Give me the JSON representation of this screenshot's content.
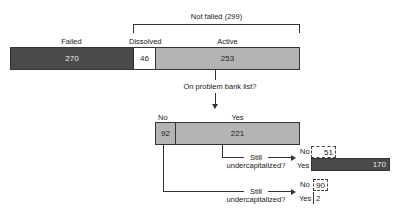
{
  "top_bar": {
    "failed": {
      "label": "Failed",
      "value": "270"
    },
    "dissolved": {
      "label": "Dissolved",
      "value": "46"
    },
    "active": {
      "label": "Active",
      "value": "253"
    },
    "bracket_label": "Not failed (299)"
  },
  "question1": "On problem bank list?",
  "second_bar": {
    "no": {
      "label": "No",
      "value": "92"
    },
    "yes": {
      "label": "Yes",
      "value": "221"
    }
  },
  "branch_yes": {
    "question_line1": "Still",
    "question_line2": "undercapitalized?",
    "no": {
      "label": "No",
      "value": "51"
    },
    "yes": {
      "label": "Yes",
      "value": "170"
    }
  },
  "branch_no": {
    "question_line1": "Still",
    "question_line2": "undercapitalized?",
    "no": {
      "label": "No",
      "value": "90"
    },
    "yes": {
      "label": "Yes",
      "value": "2"
    }
  },
  "colors": {
    "failed": "#4a4a4a",
    "active": "#b4b4b4",
    "dissolved": "#ffffff"
  }
}
